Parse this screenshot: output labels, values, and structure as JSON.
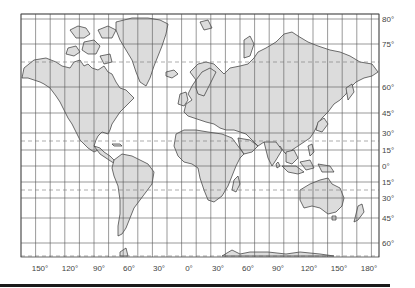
{
  "map": {
    "projection": "Mercator",
    "land_color": "#dcdcdc",
    "outline_color": "#333333",
    "grid_color": "#555555",
    "special_line_style": "dashed",
    "longitude_labels": [
      {
        "text": "150°",
        "lon": -150
      },
      {
        "text": "120°",
        "lon": -120
      },
      {
        "text": "90°",
        "lon": -90
      },
      {
        "text": "60°",
        "lon": -60
      },
      {
        "text": "30°",
        "lon": -30
      },
      {
        "text": "0°",
        "lon": 0
      },
      {
        "text": "30°",
        "lon": 30
      },
      {
        "text": "60°",
        "lon": 60
      },
      {
        "text": "90°",
        "lon": 90
      },
      {
        "text": "120°",
        "lon": 120
      },
      {
        "text": "150°",
        "lon": 150
      },
      {
        "text": "180°",
        "lon": 180
      }
    ],
    "latitude_labels": [
      {
        "text": "80°",
        "lat": 80
      },
      {
        "text": "75°",
        "lat": 75
      },
      {
        "text": "60°",
        "lat": 60
      },
      {
        "text": "45°",
        "lat": 45
      },
      {
        "text": "30°",
        "lat": 30
      },
      {
        "text": "15°",
        "lat": 15
      },
      {
        "text": "0°",
        "lat": 0
      },
      {
        "text": "15°",
        "lat": -15
      },
      {
        "text": "30°",
        "lat": -30
      },
      {
        "text": "45°",
        "lat": -45
      },
      {
        "text": "60°",
        "lat": -60
      }
    ],
    "special_parallels": [
      {
        "name": "Arctic Circle",
        "lat": 66.5
      },
      {
        "name": "Tropic of Cancer",
        "lat": 23.5
      },
      {
        "name": "Tropic of Capricorn",
        "lat": -23.5
      },
      {
        "name": "Antarctic Circle",
        "lat": -66.5
      }
    ]
  }
}
